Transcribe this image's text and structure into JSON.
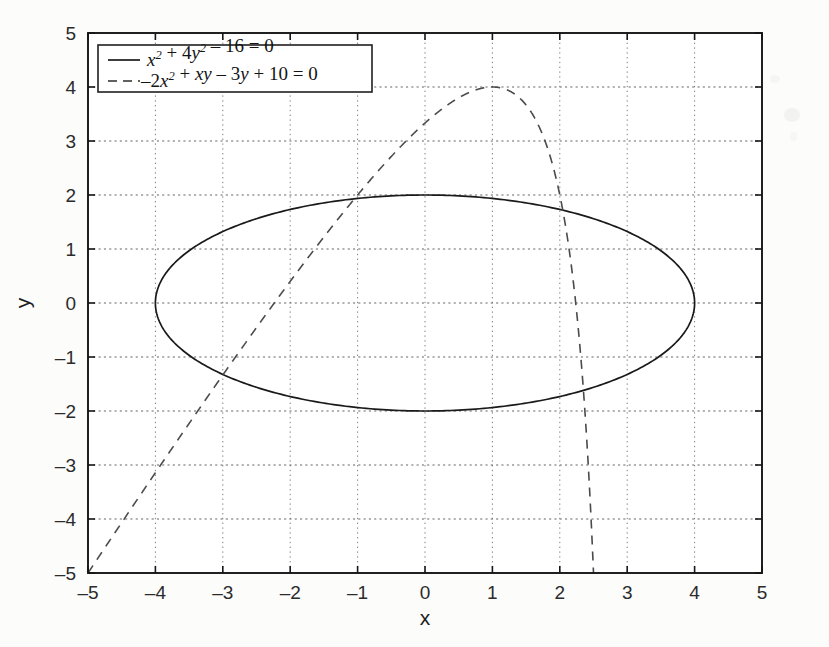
{
  "figure": {
    "background_color": "#fcfcfb",
    "plot_background_color": "#ffffff",
    "axis_color": "#1a1a1a",
    "grid_color": "#8a8a8a"
  },
  "axes": {
    "x_title": "x",
    "y_title": "y",
    "x_ticks": [
      "-5",
      "-4",
      "-3",
      "-2",
      "-1",
      "0",
      "1",
      "2",
      "3",
      "4",
      "5"
    ],
    "y_ticks": [
      "5",
      "4",
      "3",
      "2",
      "1",
      "0",
      "-1",
      "-2",
      "-3",
      "-4",
      "-5"
    ]
  },
  "legend": {
    "entries": [
      {
        "style": "solid",
        "label": "x^2 + 4y^2 - 16 = 0",
        "parts": [
          {
            "t": "x",
            "italic": true
          },
          {
            "t": "2",
            "sup": true
          },
          {
            "t": " + 4",
            "italic": false
          },
          {
            "t": "y",
            "italic": true
          },
          {
            "t": "2",
            "sup": true
          },
          {
            "t": " – 16 = 0",
            "italic": false
          }
        ]
      },
      {
        "style": "dashed",
        "label": "-2x^2 + xy - 3y + 10 = 0",
        "parts": [
          {
            "t": "–2",
            "italic": false
          },
          {
            "t": "x",
            "italic": true
          },
          {
            "t": "2",
            "sup": true
          },
          {
            "t": " + ",
            "italic": false
          },
          {
            "t": "xy",
            "italic": true
          },
          {
            "t": " – 3",
            "italic": false
          },
          {
            "t": "y",
            "italic": true
          },
          {
            "t": " + 10 = 0",
            "italic": false
          }
        ]
      }
    ]
  },
  "chart_data": {
    "type": "line",
    "title": "",
    "xlabel": "x",
    "ylabel": "y",
    "xlim": [
      -5,
      5
    ],
    "ylim": [
      -5,
      5
    ],
    "xticks": [
      -5,
      -4,
      -3,
      -2,
      -1,
      0,
      1,
      2,
      3,
      4,
      5
    ],
    "yticks": [
      -5,
      -4,
      -3,
      -2,
      -1,
      0,
      1,
      2,
      3,
      4,
      5
    ],
    "grid": true,
    "grid_style": "dotted",
    "legend_position": "upper left",
    "series": [
      {
        "name": "x^2 + 4y^2 - 16 = 0",
        "linestyle": "solid",
        "color": "#1a1a1a",
        "curve_type": "ellipse",
        "equation": "x^2 + 4*y^2 - 16 = 0",
        "semi_axis_x": 4,
        "semi_axis_y": 2,
        "center": [
          0,
          0
        ],
        "points": [
          [
            4.0,
            0.0
          ],
          [
            3.86,
            0.52
          ],
          [
            3.46,
            1.0
          ],
          [
            3.06,
            1.29
          ],
          [
            2.83,
            1.41
          ],
          [
            2.0,
            1.73
          ],
          [
            1.0,
            1.94
          ],
          [
            0.0,
            2.0
          ],
          [
            -1.0,
            1.94
          ],
          [
            -2.0,
            1.73
          ],
          [
            -2.83,
            1.41
          ],
          [
            -3.46,
            1.0
          ],
          [
            -3.86,
            0.52
          ],
          [
            -4.0,
            0.0
          ],
          [
            -3.86,
            -0.52
          ],
          [
            -3.46,
            -1.0
          ],
          [
            -2.83,
            -1.41
          ],
          [
            -2.0,
            -1.73
          ],
          [
            -1.0,
            -1.94
          ],
          [
            0.0,
            -2.0
          ],
          [
            1.0,
            -1.94
          ],
          [
            2.0,
            -1.73
          ],
          [
            2.83,
            -1.41
          ],
          [
            3.46,
            -1.0
          ],
          [
            3.86,
            -0.52
          ],
          [
            4.0,
            0.0
          ]
        ]
      },
      {
        "name": "-2x^2 + xy - 3y + 10 = 0",
        "linestyle": "dashed",
        "color": "#4a4a4a",
        "curve_type": "hyperbola",
        "equation": "y = (2*x^2 - 10) / (x - 3)",
        "vertical_asymptote_x": 3,
        "points": [
          [
            -5.0,
            -5.0
          ],
          [
            -4.5,
            -4.27
          ],
          [
            -4.0,
            -3.71
          ],
          [
            -3.5,
            -3.23
          ],
          [
            -3.0,
            -2.67
          ],
          [
            -2.5,
            -2.1
          ],
          [
            -2.0,
            -0.4
          ],
          [
            -1.9,
            -0.24
          ],
          [
            -1.5,
            1.0
          ],
          [
            -1.2,
            1.8
          ],
          [
            -1.0,
            2.0
          ],
          [
            -0.8,
            2.37
          ],
          [
            -0.5,
            2.9
          ],
          [
            0.0,
            3.33
          ],
          [
            0.3,
            3.64
          ],
          [
            0.5,
            3.8
          ],
          [
            0.8,
            4.03
          ],
          [
            1.0,
            4.0
          ],
          [
            1.2,
            3.94
          ],
          [
            1.5,
            3.67
          ],
          [
            1.8,
            3.05
          ],
          [
            2.0,
            2.0
          ],
          [
            2.2,
            0.8
          ],
          [
            2.35,
            -0.62
          ],
          [
            2.45,
            -1.86
          ],
          [
            2.5,
            -5.0
          ]
        ]
      }
    ],
    "intersections_visible": [
      [
        -1.0,
        2.0
      ],
      [
        2.0,
        2.0
      ],
      [
        -2.0,
        -1.73
      ]
    ]
  }
}
